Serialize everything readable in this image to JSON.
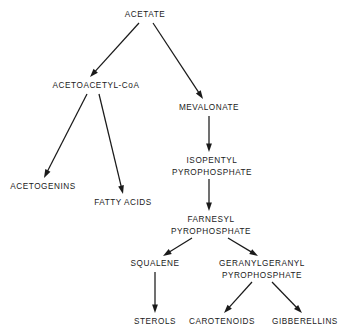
{
  "diagram": {
    "type": "flowchart",
    "background_color": "#ffffff",
    "line_color": "#1a1a1a",
    "text_color": "#1a1a1a",
    "nodes": [
      {
        "id": "acetate",
        "label_lines": [
          "ACETATE"
        ],
        "x": 145,
        "y": 17
      },
      {
        "id": "acetoacetyl_coa",
        "label_lines": [
          "ACETOACETYL-CoA"
        ],
        "x": 96,
        "y": 88
      },
      {
        "id": "mevalonate",
        "label_lines": [
          "MEVALONATE"
        ],
        "x": 209,
        "y": 110
      },
      {
        "id": "acetogenins",
        "label_lines": [
          "ACETOGENINS"
        ],
        "x": 43,
        "y": 189
      },
      {
        "id": "fatty_acids",
        "label_lines": [
          "FATTY ACIDS"
        ],
        "x": 123,
        "y": 205
      },
      {
        "id": "isopentyl_pp",
        "label_lines": [
          "ISOPENTYL",
          "PYROPHOSPHATE"
        ],
        "x": 212,
        "y": 163
      },
      {
        "id": "farnesyl_pp",
        "label_lines": [
          "FARNESYL",
          "PYROPHOSPHATE"
        ],
        "x": 211,
        "y": 222
      },
      {
        "id": "squalene",
        "label_lines": [
          "SQUALENE"
        ],
        "x": 155,
        "y": 266
      },
      {
        "id": "geranylgeranyl_pp",
        "label_lines": [
          "GERANYLGERANYL",
          "PYROPHOSPHATE"
        ],
        "x": 262,
        "y": 266
      },
      {
        "id": "sterols",
        "label_lines": [
          "STEROLS"
        ],
        "x": 155,
        "y": 324
      },
      {
        "id": "carotenoids",
        "label_lines": [
          "CAROTENOIDS"
        ],
        "x": 222,
        "y": 324
      },
      {
        "id": "gibberellins",
        "label_lines": [
          "GIBBERELLINS"
        ],
        "x": 305,
        "y": 324
      }
    ],
    "edges": [
      {
        "id": "acetate-to-acetoacetyl",
        "from": "acetate",
        "to": "acetoacetyl_coa",
        "x1": 139,
        "y1": 23,
        "x2": 90,
        "y2": 77
      },
      {
        "id": "acetate-to-mevalonate",
        "from": "acetate",
        "to": "mevalonate",
        "x1": 153,
        "y1": 23,
        "x2": 203,
        "y2": 99
      },
      {
        "id": "acetoacetyl-to-acetogenins",
        "from": "acetoacetyl_coa",
        "to": "acetogenins",
        "x1": 87,
        "y1": 94,
        "x2": 44,
        "y2": 178
      },
      {
        "id": "acetoacetyl-to-fatty-acids",
        "from": "acetoacetyl_coa",
        "to": "fatty_acids",
        "x1": 99,
        "y1": 94,
        "x2": 123,
        "y2": 194
      },
      {
        "id": "mevalonate-to-isopentyl",
        "from": "mevalonate",
        "to": "isopentyl_pp",
        "x1": 209,
        "y1": 116,
        "x2": 209,
        "y2": 152
      },
      {
        "id": "isopentyl-to-farnesyl",
        "from": "isopentyl_pp",
        "to": "farnesyl_pp",
        "x1": 209,
        "y1": 179,
        "x2": 209,
        "y2": 211
      },
      {
        "id": "farnesyl-to-squalene",
        "from": "farnesyl_pp",
        "to": "squalene",
        "x1": 192,
        "y1": 238,
        "x2": 163,
        "y2": 256
      },
      {
        "id": "farnesyl-to-geranylgeranyl",
        "from": "farnesyl_pp",
        "to": "geranylgeranyl_pp",
        "x1": 228,
        "y1": 238,
        "x2": 258,
        "y2": 256
      },
      {
        "id": "squalene-to-sterols",
        "from": "squalene",
        "to": "sterols",
        "x1": 155,
        "y1": 272,
        "x2": 155,
        "y2": 313
      },
      {
        "id": "geranylgeranyl-to-carotenoids",
        "from": "geranylgeranyl_pp",
        "to": "carotenoids",
        "x1": 252,
        "y1": 282,
        "x2": 224,
        "y2": 313
      },
      {
        "id": "geranylgeranyl-to-gibberellins",
        "from": "geranylgeranyl_pp",
        "to": "gibberellins",
        "x1": 272,
        "y1": 282,
        "x2": 302,
        "y2": 313
      }
    ]
  }
}
